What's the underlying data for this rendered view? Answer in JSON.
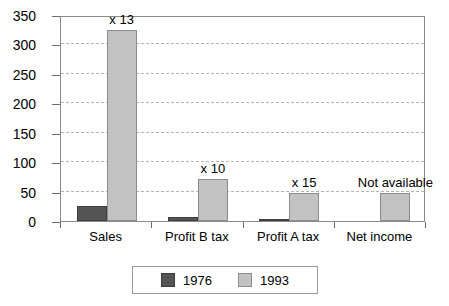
{
  "chart_data": {
    "type": "bar",
    "title": "",
    "subtitle": "",
    "xlabel": "",
    "ylabel": "",
    "ylim": [
      0,
      350
    ],
    "yticks": [
      0,
      50,
      100,
      150,
      200,
      250,
      300,
      350
    ],
    "ytick_labels": [
      "0",
      "50",
      "100",
      "150",
      "200",
      "250",
      "300",
      "350"
    ],
    "grid": true,
    "legend_position": "bottom",
    "categories": [
      "Sales",
      "Profit B tax",
      "Profit A tax",
      "Net income"
    ],
    "series": [
      {
        "name": "1976",
        "color": "#555555",
        "values": [
          25,
          7,
          3,
          null
        ]
      },
      {
        "name": "1993",
        "color": "#c2c2c2",
        "values": [
          325,
          72,
          48,
          48
        ]
      }
    ],
    "annotations": [
      {
        "category": "Sales",
        "text": "x 13"
      },
      {
        "category": "Profit B tax",
        "text": "x 10"
      },
      {
        "category": "Profit A tax",
        "text": "x 15"
      },
      {
        "category": "Net income",
        "text": "Not available"
      }
    ]
  },
  "legend": {
    "entries": [
      {
        "label": "1976",
        "swatch": "dark-swatch"
      },
      {
        "label": "1993",
        "swatch": "light-swatch"
      }
    ]
  }
}
